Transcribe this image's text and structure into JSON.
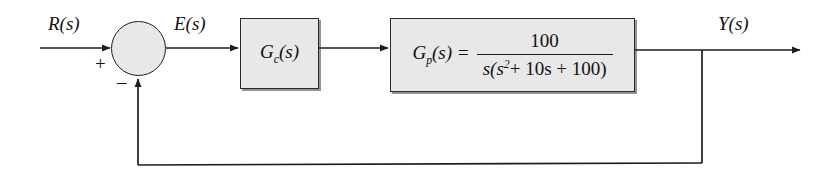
{
  "diagram": {
    "type": "control-system-block-diagram",
    "signals": {
      "input": "R(s)",
      "error": "E(s)",
      "output": "Y(s)"
    },
    "summing_junction": {
      "name": "summing-junction",
      "positive_sign": "+",
      "negative_sign": "–",
      "inputs": [
        "R(s)",
        "feedback"
      ],
      "output": "E(s)"
    },
    "blocks": [
      {
        "id": "controller",
        "label_base": "G",
        "label_sub": "c",
        "label_arg": "(s)",
        "label_full": "G_c(s)"
      },
      {
        "id": "plant",
        "lhs_base": "G",
        "lhs_sub": "p",
        "lhs_arg": "(s) =",
        "numerator": "100",
        "denominator_prefix": "s(s",
        "denominator_exp": "2",
        "denominator_suffix": "+ 10s + 100)",
        "label_full": "G_p(s) = 100 / (s(s^2 + 10s + 100))"
      }
    ],
    "feedback": {
      "type": "unity",
      "gain": "1"
    },
    "colors": {
      "block_fill": "#e8e8e8",
      "line": "#1d1d1d",
      "background": "#ffffff",
      "text": "#111111"
    }
  }
}
